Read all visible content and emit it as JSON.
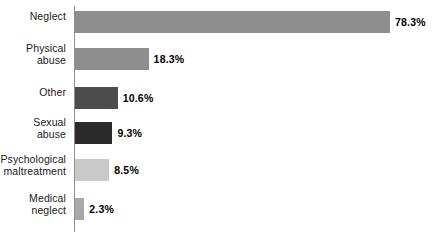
{
  "chart_data": {
    "type": "bar",
    "orientation": "horizontal",
    "title": "",
    "subtitle": "",
    "xlabel": "",
    "ylabel": "",
    "xlim": [
      0,
      80
    ],
    "grid": false,
    "legend": false,
    "categories": [
      "Neglect",
      "Physical\nabuse",
      "Other",
      "Sexual\nabuse",
      "Psychological\nmaltreatment",
      "Medical\nneglect"
    ],
    "values": [
      78.3,
      18.3,
      10.6,
      9.3,
      8.5,
      2.3
    ],
    "value_labels": [
      "78.3%",
      "18.3%",
      "10.6%",
      "9.3%",
      "8.5%",
      "2.3%"
    ],
    "bar_colors": [
      "#8e8e8e",
      "#8e8e8e",
      "#4c4c4c",
      "#2b2b2b",
      "#c9c9c9",
      "#a8a8a8"
    ],
    "axis_color": "#8f8f8f",
    "background": "#ffffff",
    "bars": [
      {
        "label": "Neglect",
        "label_lines": 1,
        "value": 78.3,
        "value_label": "78.3%",
        "color": "#8e8e8e",
        "top": 11
      },
      {
        "label": "Physical abuse",
        "label_lines": 2,
        "value": 18.3,
        "value_label": "18.3%",
        "color": "#8e8e8e",
        "top": 48
      },
      {
        "label": "Other",
        "label_lines": 1,
        "value": 10.6,
        "value_label": "10.6%",
        "color": "#4c4c4c",
        "top": 87
      },
      {
        "label": "Sexual abuse",
        "label_lines": 2,
        "value": 9.3,
        "value_label": "9.3%",
        "color": "#2b2b2b",
        "top": 122
      },
      {
        "label": "Psychological maltreatment",
        "label_lines": 2,
        "value": 8.5,
        "value_label": "8.5%",
        "color": "#c9c9c9",
        "top": 159
      },
      {
        "label": "Medical neglect",
        "label_lines": 2,
        "value": 2.3,
        "value_label": "2.3%",
        "color": "#a8a8a8",
        "top": 198
      }
    ]
  }
}
